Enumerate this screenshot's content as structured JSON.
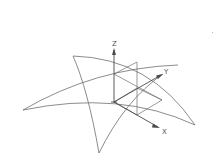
{
  "diagram": {
    "axes": {
      "z_label": "Z",
      "y_label": "Y",
      "x_label": "X"
    },
    "colors": {
      "stroke": "#6e6e6e",
      "axis": "#4a4a4a",
      "background": "#ffffff"
    }
  }
}
